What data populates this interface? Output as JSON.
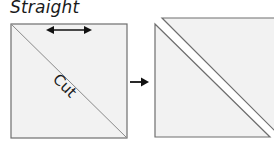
{
  "diagram": {
    "title": "Straight",
    "cut_label": "Cut",
    "grain_arrow": "double-headed-arrow",
    "process_arrow": "right-arrow",
    "colors": {
      "fill": "#f2f2f2",
      "stroke": "#6e6e6e",
      "cut_line": "#8a8a8a",
      "arrow": "#111111"
    },
    "steps": [
      {
        "name": "square-before-cut",
        "description": "Square with diagonal cut line"
      },
      {
        "name": "two-triangles-after-cut",
        "description": "Two half-square triangles separated"
      }
    ]
  }
}
